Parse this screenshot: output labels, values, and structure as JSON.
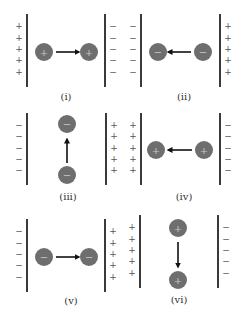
{
  "figure": {
    "colors": {
      "plate": "#3a3a3a",
      "ball": "#6e6e6e",
      "ball_sign": "#c8c8c8",
      "arrow": "#111111",
      "sign": "#555555",
      "label": "#333333"
    },
    "panels": [
      {
        "label": "(i)",
        "label_pos": [
          66,
          100
        ],
        "plates": [
          {
            "x": 27,
            "y1": 14,
            "y2": 87,
            "signs": "+",
            "sign_side": "left"
          },
          {
            "x": 105,
            "y1": 14,
            "y2": 87,
            "signs": "−",
            "sign_side": "right"
          }
        ],
        "balls": [
          {
            "cx": 44,
            "cy": 52,
            "charge": "+"
          },
          {
            "cx": 89,
            "cy": 52,
            "charge": "+"
          }
        ],
        "arrow": {
          "from": [
            56,
            52
          ],
          "to": [
            79,
            52
          ],
          "direction": "right"
        }
      },
      {
        "label": "(ii)",
        "label_pos": [
          184,
          100
        ],
        "plates": [
          {
            "x": 141,
            "y1": 14,
            "y2": 87,
            "signs": "−",
            "sign_side": "left"
          },
          {
            "x": 220,
            "y1": 14,
            "y2": 87,
            "signs": "+",
            "sign_side": "right"
          }
        ],
        "balls": [
          {
            "cx": 158,
            "cy": 52,
            "charge": "−"
          },
          {
            "cx": 203,
            "cy": 52,
            "charge": "−"
          }
        ],
        "arrow": {
          "from": [
            191,
            52
          ],
          "to": [
            168,
            52
          ],
          "direction": "left"
        }
      },
      {
        "label": "(iii)",
        "label_pos": [
          68,
          200
        ],
        "plates": [
          {
            "x": 27,
            "y1": 113,
            "y2": 185,
            "signs": "−",
            "sign_side": "left"
          },
          {
            "x": 106,
            "y1": 113,
            "y2": 185,
            "signs": "+",
            "sign_side": "right"
          }
        ],
        "balls": [
          {
            "cx": 67,
            "cy": 124,
            "charge": "−"
          },
          {
            "cx": 67,
            "cy": 175,
            "charge": "−"
          }
        ],
        "arrow": {
          "from": [
            67,
            163
          ],
          "to": [
            67,
            139
          ],
          "direction": "up"
        }
      },
      {
        "label": "(iv)",
        "label_pos": [
          184,
          200
        ],
        "plates": [
          {
            "x": 141,
            "y1": 113,
            "y2": 185,
            "signs": "+",
            "sign_side": "left"
          },
          {
            "x": 220,
            "y1": 113,
            "y2": 185,
            "signs": "−",
            "sign_side": "right"
          }
        ],
        "balls": [
          {
            "cx": 156,
            "cy": 150,
            "charge": "+"
          },
          {
            "cx": 204,
            "cy": 150,
            "charge": "+"
          }
        ],
        "arrow": {
          "from": [
            192,
            150
          ],
          "to": [
            168,
            150
          ],
          "direction": "left"
        }
      },
      {
        "label": "(v)",
        "label_pos": [
          71,
          304
        ],
        "plates": [
          {
            "x": 27,
            "y1": 219,
            "y2": 292,
            "signs": "−",
            "sign_side": "left"
          },
          {
            "x": 105,
            "y1": 219,
            "y2": 292,
            "signs": "+",
            "sign_side": "right"
          }
        ],
        "balls": [
          {
            "cx": 44,
            "cy": 257,
            "charge": "−"
          },
          {
            "cx": 89,
            "cy": 257,
            "charge": "−"
          }
        ],
        "arrow": {
          "from": [
            56,
            257
          ],
          "to": [
            79,
            257
          ],
          "direction": "right"
        }
      },
      {
        "label": "(vi)",
        "label_pos": [
          179,
          303
        ],
        "plates": [
          {
            "x": 140,
            "y1": 215,
            "y2": 288,
            "signs": "+",
            "sign_side": "left"
          },
          {
            "x": 218,
            "y1": 215,
            "y2": 288,
            "signs": "−",
            "sign_side": "right"
          }
        ],
        "balls": [
          {
            "cx": 178,
            "cy": 228,
            "charge": "+"
          },
          {
            "cx": 178,
            "cy": 280,
            "charge": "+"
          }
        ],
        "arrow": {
          "from": [
            178,
            242
          ],
          "to": [
            178,
            267
          ],
          "direction": "down"
        }
      }
    ]
  }
}
